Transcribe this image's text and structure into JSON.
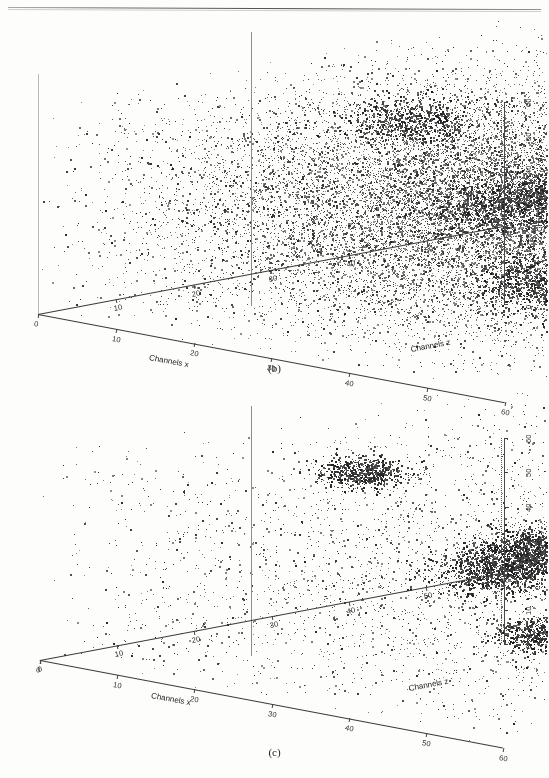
{
  "figure": {
    "background": "#fdfdfc",
    "ink": "#2b2b2b",
    "point_color": "#333333"
  },
  "panels": [
    {
      "id": "b",
      "caption": "(b)",
      "description": "dense unresolved three-dimensional spectrum",
      "axes": {
        "x": {
          "title": "Channels x",
          "ticks": [
            "0",
            "10",
            "20",
            "30",
            "40",
            "50",
            "60"
          ],
          "min": 0,
          "max": 60
        },
        "z": {
          "title": "Channels z",
          "ticks": [
            "60",
            "50",
            "40",
            "30",
            "20",
            "10"
          ],
          "min": 0,
          "max": 60
        },
        "y": {
          "title": "Channels y",
          "ticks": [
            "0",
            "10",
            "20",
            "30",
            "40",
            "50",
            "60"
          ],
          "min": 0,
          "max": 60
        }
      }
    },
    {
      "id": "c",
      "caption": "(c)",
      "description": "resolved spectrum showing five separated peak clusters",
      "axes": {
        "x": {
          "title": "Channels x",
          "ticks": [
            "0",
            "10",
            "20",
            "30",
            "40",
            "50",
            "60"
          ],
          "min": 0,
          "max": 60
        },
        "z": {
          "title": "Channels z",
          "ticks": [
            "0",
            "10",
            "20",
            "30",
            "40",
            "50",
            "60"
          ],
          "min": 0,
          "max": 60
        },
        "y": {
          "title": "Channels y",
          "ticks": [
            "0",
            "10",
            "20",
            "30",
            "40",
            "50",
            "60"
          ],
          "min": 0,
          "max": 60
        }
      }
    }
  ],
  "chart_data": [
    {
      "type": "scatter",
      "panel": "b",
      "title": "(b)",
      "projection": "3d",
      "xlabel": "Channels x",
      "ylabel": "Channels y",
      "zlabel": "Channels z",
      "xlim": [
        0,
        60
      ],
      "ylim": [
        0,
        60
      ],
      "zlim": [
        0,
        60
      ],
      "xticks": [
        0,
        10,
        20,
        30,
        40,
        50,
        60
      ],
      "yticks": [
        0,
        10,
        20,
        30,
        40,
        50,
        60
      ],
      "zticks": [
        10,
        20,
        30,
        40,
        50,
        60
      ],
      "grid": false,
      "legend": null,
      "n_points": 26000,
      "noise_floor_points": 22000,
      "series": [
        {
          "name": "background noise",
          "distribution": "uniform-with-central-density",
          "n": 22000
        },
        {
          "name": "peaks (unresolved)",
          "n": 4000,
          "clusters": [
            {
              "x": 18,
              "y": 50,
              "z": 30,
              "n": 700,
              "sigma": 3.0
            },
            {
              "x": 30,
              "y": 30,
              "z": 30,
              "n": 1100,
              "sigma": 4.0
            },
            {
              "x": 44,
              "y": 44,
              "z": 22,
              "n": 700,
              "sigma": 3.2
            },
            {
              "x": 46,
              "y": 20,
              "z": 18,
              "n": 700,
              "sigma": 3.2
            },
            {
              "x": 36,
              "y": 12,
              "z": 34,
              "n": 800,
              "sigma": 3.4
            }
          ]
        }
      ]
    },
    {
      "type": "scatter",
      "panel": "c",
      "title": "(c)",
      "projection": "3d",
      "xlabel": "Channels x",
      "ylabel": "Channels y",
      "zlabel": "Channels z",
      "xlim": [
        0,
        60
      ],
      "ylim": [
        0,
        60
      ],
      "zlim": [
        0,
        60
      ],
      "xticks": [
        0,
        10,
        20,
        30,
        40,
        50,
        60
      ],
      "yticks": [
        0,
        10,
        20,
        30,
        40,
        50,
        60
      ],
      "zticks": [
        0,
        10,
        20,
        30,
        40,
        50,
        60
      ],
      "grid": false,
      "legend": null,
      "n_points": 9000,
      "noise_floor_points": 4200,
      "series": [
        {
          "name": "residual background",
          "distribution": "sparse-uniform",
          "n": 4200
        },
        {
          "name": "resolved peaks",
          "n": 4800,
          "clusters": [
            {
              "label": "cluster-1",
              "x": 16,
              "y": 50,
              "z": 26,
              "n": 700,
              "sigma": 2.1
            },
            {
              "label": "cluster-2",
              "x": 30,
              "y": 26,
              "z": 30,
              "n": 1500,
              "sigma": 3.0
            },
            {
              "label": "cluster-3",
              "x": 45,
              "y": 43,
              "z": 20,
              "n": 1100,
              "sigma": 2.8
            },
            {
              "label": "cluster-4",
              "x": 50,
              "y": 22,
              "z": 15,
              "n": 700,
              "sigma": 2.2
            },
            {
              "label": "cluster-5",
              "x": 40,
              "y": 9,
              "z": 33,
              "n": 800,
              "sigma": 2.4
            }
          ]
        }
      ]
    }
  ]
}
